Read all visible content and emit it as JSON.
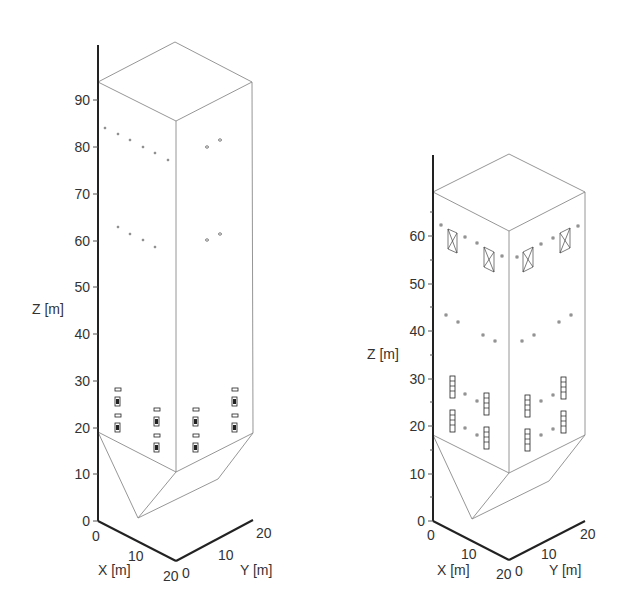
{
  "figure": {
    "panels": [
      {
        "id": "left",
        "description": "Tall silo with hopper bottom, isometric view",
        "z_axis": {
          "label": "Z [m]",
          "ticks": [
            "0",
            "10",
            "20",
            "30",
            "40",
            "50",
            "60",
            "70",
            "80",
            "90"
          ]
        },
        "x_axis": {
          "label": "X [m]",
          "ticks": [
            "0",
            "10",
            "20"
          ]
        },
        "y_axis": {
          "label": "Y [m]",
          "ticks": [
            "0",
            "10",
            "20"
          ]
        }
      },
      {
        "id": "right",
        "description": "Shorter silo with hopper bottom, isometric view",
        "z_axis": {
          "label": "Z [m]",
          "ticks": [
            "0",
            "10",
            "20",
            "30",
            "40",
            "50",
            "60"
          ]
        },
        "x_axis": {
          "label": "X [m]",
          "ticks": [
            "0",
            "10",
            "20"
          ]
        },
        "y_axis": {
          "label": "Y [m]",
          "ticks": [
            "0",
            "10",
            "20"
          ]
        }
      }
    ],
    "colors": {
      "axis": "#222222",
      "edge": "#8a8a8a",
      "text": "#333333"
    }
  }
}
